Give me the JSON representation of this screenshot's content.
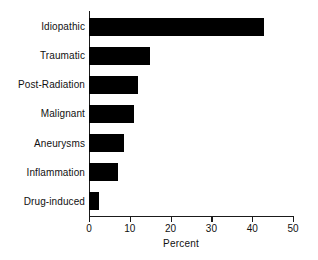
{
  "chart_data": {
    "type": "bar",
    "orientation": "horizontal",
    "title": "",
    "xlabel": "Percent",
    "ylabel": "",
    "xlim": [
      0,
      50
    ],
    "xticks": [
      0,
      10,
      20,
      30,
      40,
      50
    ],
    "xtick_labels": [
      "0",
      "10",
      "20",
      "30",
      "40",
      "50"
    ],
    "grid": false,
    "legend": null,
    "bar_color": "#000000",
    "axis_color": "#1a1a1a",
    "categories": [
      "Idiopathic",
      "Traumatic",
      "Post-Radiation",
      "Malignant",
      "Aneurysms",
      "Inflammation",
      "Drug-induced"
    ],
    "values": [
      43,
      15,
      12,
      11,
      8.5,
      7,
      2.5
    ]
  }
}
